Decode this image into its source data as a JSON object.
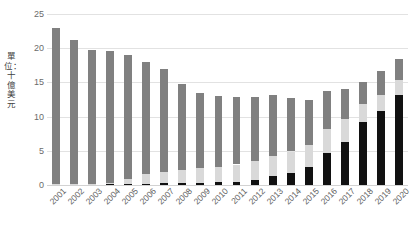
{
  "chart_data": {
    "type": "bar",
    "stacked": true,
    "title": "",
    "subtitle": "",
    "xlabel": "",
    "ylabel": "單位：十億美元",
    "ylim": [
      0,
      25
    ],
    "yticks": [
      0,
      5,
      10,
      15,
      20,
      25
    ],
    "ytick_labels": [
      "0",
      "5",
      "10",
      "15",
      "20",
      "25"
    ],
    "grid": true,
    "grid_axis": "y",
    "legend": null,
    "legend_position": "none",
    "categories": [
      "2001",
      "2002",
      "2003",
      "2004",
      "2005",
      "2006",
      "2007",
      "2008",
      "2009",
      "2010",
      "2011",
      "2012",
      "2013",
      "2014",
      "2015",
      "2016",
      "2017",
      "2018",
      "2019",
      "2020"
    ],
    "series": [
      {
        "name": "series-bottom-black",
        "color": "#111111",
        "values": [
          0.1,
          0.1,
          0.1,
          0.1,
          0.15,
          0.2,
          0.25,
          0.3,
          0.35,
          0.4,
          0.5,
          0.8,
          1.3,
          1.8,
          2.6,
          4.7,
          6.3,
          9.2,
          10.8,
          13.2
        ]
      },
      {
        "name": "series-middle-lightgray",
        "color": "#d9d9d9",
        "values": [
          0.1,
          0.1,
          0.1,
          0.15,
          0.8,
          1.4,
          1.7,
          1.9,
          2.1,
          2.3,
          2.5,
          2.7,
          2.9,
          3.1,
          3.3,
          3.5,
          3.4,
          2.6,
          2.3,
          2.1
        ]
      },
      {
        "name": "series-top-darkgray",
        "color": "#808080",
        "values": [
          22.8,
          21.0,
          19.6,
          19.35,
          18.05,
          16.4,
          15.05,
          12.6,
          11.05,
          10.3,
          9.9,
          9.3,
          8.9,
          7.8,
          6.6,
          5.5,
          4.4,
          3.2,
          3.6,
          3.1
        ]
      }
    ],
    "totals": [
      23.0,
      21.2,
      19.8,
      19.6,
      19.0,
      18.0,
      17.0,
      14.8,
      13.5,
      13.0,
      12.9,
      12.8,
      13.1,
      12.7,
      12.5,
      13.7,
      14.1,
      15.0,
      16.7,
      18.4
    ]
  },
  "colors": {
    "background": "#ffffff",
    "gridline": "#e2e2e2",
    "axis_text": "#6b6b6b",
    "label_text": "#5c5c5c",
    "series_top": "#808080",
    "series_middle": "#d9d9d9",
    "series_bottom": "#111111"
  }
}
